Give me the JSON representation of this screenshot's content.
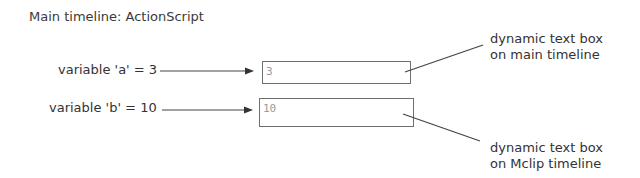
{
  "diagram": {
    "title": "Main timeline: ActionScript",
    "variables": [
      {
        "label": "variable 'a' = 3",
        "box_value": "3"
      },
      {
        "label": "variable 'b' = 10",
        "box_value": "10"
      }
    ],
    "callouts": [
      {
        "line1": "dynamic text box",
        "line2": "on main timeline"
      },
      {
        "line1": "dynamic text box",
        "line2": "on Mclip timeline"
      }
    ],
    "colors": {
      "text": "#333333",
      "line": "#444444",
      "box_border": "#6f6f6f",
      "box_text": "#9a9a9a"
    }
  }
}
